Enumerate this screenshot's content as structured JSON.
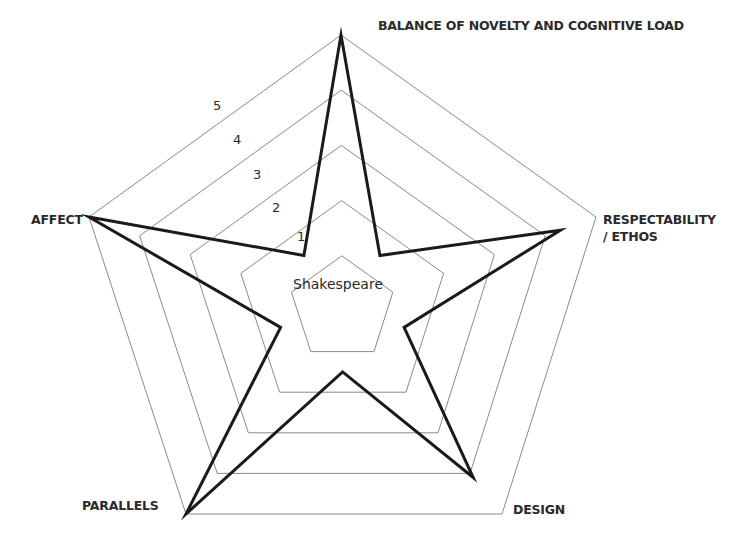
{
  "chart_data": {
    "type": "radar",
    "title": "",
    "series": [
      {
        "name": "Shakespeare",
        "values": [
          5,
          4.3,
          4.1,
          5,
          5
        ]
      }
    ],
    "categories": [
      "BALANCE OF NOVELTY AND COGNITIVE LOAD",
      "RESPECTABILITY / ETHOS",
      "DESIGN",
      "PARALLELS",
      "AFFECT"
    ],
    "ring_labels": [
      "1",
      "2",
      "3",
      "4",
      "5"
    ],
    "range": [
      0,
      5
    ],
    "grid": true,
    "legend": "none",
    "center_label": "Shakespeare",
    "colors": {
      "series_stroke": "#1a1a1a",
      "grid_stroke": "#8a8a8a",
      "text": "#2a2a2a"
    }
  },
  "labels": {
    "balance_line1": "BALANCE OF NOVELTY AND COGNITIVE LOAD",
    "respectability_line1": "RESPECTABILITY",
    "respectability_line2": "/ ETHOS",
    "design": "DESIGN",
    "parallels": "PARALLELS",
    "affect": "AFFECT",
    "center": "Shakespeare",
    "rings": [
      "1",
      "2",
      "3",
      "4",
      "5"
    ]
  }
}
